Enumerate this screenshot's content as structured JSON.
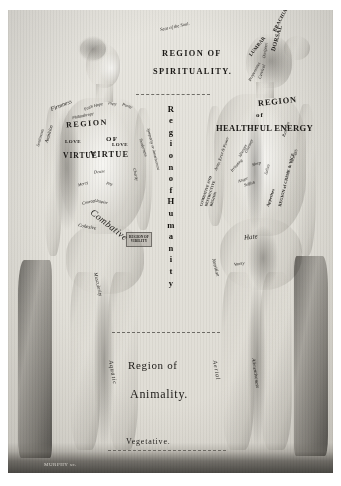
{
  "plate": {
    "title_top": "Seat of the Soul.",
    "region_spirituality_line1": "REGION OF",
    "region_spirituality_line2": "SPIRITUALITY.",
    "humanity_letters": [
      "R",
      "e",
      "g",
      "i",
      "o",
      "n",
      "",
      "o",
      "f",
      "",
      "H",
      "u",
      "m",
      "a",
      "n",
      "i",
      "t",
      "y"
    ],
    "region_animality_line1": "Region of",
    "region_animality_line2": "Animality.",
    "vegetative": "Vegetative.",
    "signature": "MURPHY sc."
  },
  "left_figure": {
    "name": "front-view-figure",
    "chest": {
      "region_line1": "REGION",
      "region_line2": "OF",
      "region_line3": "VIRTUE",
      "love_left": "LOVE",
      "love_right": "LOVE"
    },
    "upper_labels": [
      "Firmness",
      "Faith",
      "Hope",
      "Piety",
      "Purity",
      "Philanthropy"
    ],
    "side_labels": [
      "Ambition",
      "Sentiments",
      "Tenderness",
      "Sympathy or Amativeness",
      "Charity"
    ],
    "torso_labels": [
      "Desire",
      "Mercy",
      "Pity",
      "Inspire",
      "Courage"
    ],
    "arm_label": "Combative",
    "below_labels": [
      "Cohesive",
      "Muscularity",
      "Aquatic"
    ],
    "badge": "REGION OF VIRILITY"
  },
  "right_figure": {
    "name": "back-view-figure",
    "head_labels": [
      "BRACHIAL",
      "DORSAL",
      "LUMBAR",
      "Occipital",
      "Cervical",
      "Propensities"
    ],
    "back_region": {
      "line1": "REGION",
      "line2": "of",
      "line3": "HEALTHFUL  ENERGY"
    },
    "back_labels": [
      "Restraint",
      "Gluttony",
      "Sleep",
      "Idleness",
      "Irritating",
      "Selfish",
      "Sullen",
      "Anger",
      "Appetites",
      "Strength",
      "Army, force & Power",
      "Hate",
      "Vanity",
      "Nutrition",
      "Aerial",
      "Alimentiveness"
    ],
    "crime_region": "REGION of CRIME & VICE",
    "destructive_region_line1": "COMBATIVE AND",
    "destructive_region_line2": "DESTRUCTIVE",
    "destructive_region_line3": "REGION"
  },
  "colors": {
    "paper": "#e5e2db",
    "ink": "#1d1b18",
    "plate_border": "#b9b5ac"
  }
}
